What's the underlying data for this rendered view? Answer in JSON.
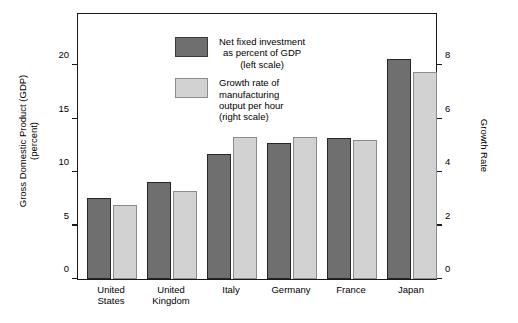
{
  "chart_data": {
    "type": "bar",
    "title": "",
    "subtitle": "",
    "categories": [
      "United States",
      "United Kingdom",
      "Italy",
      "Germany",
      "France",
      "Japan"
    ],
    "category_lines": [
      [
        "United",
        "States"
      ],
      [
        "United",
        "Kingdom"
      ],
      [
        "Italy"
      ],
      [
        "Germany"
      ],
      [
        "France"
      ],
      [
        "Japan"
      ]
    ],
    "series": [
      {
        "name": "Net fixed investment as percent of GDP (left scale)",
        "axis": "left",
        "color": "#6f6f6f",
        "border_color": "#262626",
        "values": [
          7.1,
          8.5,
          11.0,
          12.0,
          12.4,
          19.4
        ]
      },
      {
        "name": "Growth rate of manufacturing output per hour (right scale)",
        "axis": "right",
        "color": "#d2d2d2",
        "border_color": "#8c8c8c",
        "values": [
          2.6,
          3.1,
          5.0,
          5.0,
          4.9,
          7.3
        ]
      }
    ],
    "xlabel": "",
    "ylabel": "Gross Domestic Product (GDP) (percent)",
    "y2label": "Growth Rate",
    "ylim": [
      0,
      23.5
    ],
    "y2lim": [
      0,
      9.4
    ],
    "yticks": [
      0,
      5,
      10,
      15,
      20
    ],
    "y2ticks": [
      0,
      2,
      4,
      6,
      8
    ],
    "grid": false,
    "legend_position": "top-left"
  },
  "axes": {
    "left": {
      "title_line1": "Gross Domestic Product (GDP)",
      "title_line2": "(percent)",
      "ticklabels": [
        "0",
        "5",
        "10",
        "15",
        "20"
      ]
    },
    "right": {
      "title": "Growth Rate",
      "ticklabels": [
        "0",
        "2",
        "4",
        "6",
        "8"
      ]
    }
  },
  "legend": {
    "entries": [
      {
        "swatch": "dark",
        "lines": [
          "Net fixed investment",
          "as percent of GDP",
          "(left scale)"
        ]
      },
      {
        "swatch": "light",
        "lines": [
          "Growth rate of",
          "manufacturing",
          "output per hour",
          "(right scale)"
        ]
      }
    ]
  }
}
